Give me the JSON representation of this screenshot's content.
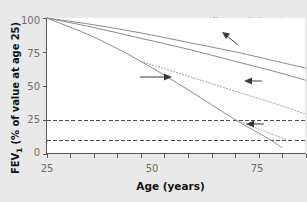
{
  "chart_data": {
    "type": "line",
    "title": "",
    "xlabel": "Age (years)",
    "ylabel": "FEV",
    "ylabel_sub": "1",
    "ylabel_rest": " (% of value at age 25)",
    "xlim": [
      25,
      80
    ],
    "ylim": [
      0,
      100
    ],
    "xticks": [
      25,
      30,
      35,
      40,
      45,
      50,
      55,
      60,
      65,
      70,
      75,
      80
    ],
    "xtick_labels": [
      "25",
      "",
      "",
      "",
      "",
      "50",
      "",
      "",
      "",
      "",
      "75",
      ""
    ],
    "yticks": [
      0,
      25,
      50,
      75,
      100
    ],
    "ytick_labels": [
      "0",
      "25",
      "50",
      "75",
      "100"
    ],
    "grid": false,
    "legend_position": "none",
    "reference_lines": [
      {
        "name": "Disability",
        "label": "Disability",
        "y": 25,
        "style": "dashed"
      },
      {
        "name": "Death",
        "label": "Death",
        "y": 10,
        "style": "dashed"
      }
    ],
    "series": [
      {
        "name": "Never smoked or not susceptible to smoke (upper)",
        "style": "solid",
        "color": "#8a8a8a",
        "x": [
          25,
          35,
          45,
          55,
          65,
          75,
          80
        ],
        "values": [
          100,
          95,
          89,
          82,
          75,
          67,
          63
        ]
      },
      {
        "name": "Never smoked or not susceptible to smoke (lower)",
        "style": "solid",
        "color": "#8a8a8a",
        "x": [
          25,
          35,
          45,
          55,
          65,
          75,
          80
        ],
        "values": [
          100,
          93,
          85,
          77,
          68,
          59,
          54
        ]
      },
      {
        "name": "Smoked regularly and susceptible to it's effects",
        "style": "solid",
        "color": "#8a8a8a",
        "x": [
          25,
          35,
          45,
          55,
          65,
          72,
          75
        ],
        "values": [
          100,
          86,
          68,
          47,
          25,
          11,
          4
        ]
      },
      {
        "name": "Stopped at 45",
        "style": "dotted",
        "color": "#9a9a9a",
        "x": [
          45,
          55,
          65,
          75,
          80
        ],
        "values": [
          68,
          57,
          46,
          35,
          29
        ]
      },
      {
        "name": "Stopped at 65",
        "style": "dotted",
        "color": "#9a9a9a",
        "x": [
          65,
          70,
          76
        ],
        "values": [
          25,
          18,
          10
        ]
      }
    ],
    "annotations": [
      {
        "name": "smoker-annotation",
        "text": "Smoked\nregularly and\nsusceptible to\nit's effects"
      },
      {
        "name": "never-smoked-annotation",
        "text": "Never smoked or not\nsusceptible to smoke"
      },
      {
        "name": "stopped-at-45-annotation",
        "text": "Stopped\nat 45"
      },
      {
        "name": "stopped-at-65-annotation",
        "text": "Stopped\nat 65"
      }
    ]
  }
}
